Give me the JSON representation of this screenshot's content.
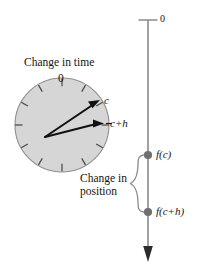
{
  "figure": {
    "type": "calculus-rate-of-change-diagram",
    "background_color": "#ffffff",
    "width": 198,
    "height": 268
  },
  "clock": {
    "caption": "Change in time",
    "dial_zero_label": "0",
    "hand_labels": {
      "short_hand": "c",
      "long_hand": "c+h"
    },
    "face_color": "#d6d6d6",
    "outline_color": "#8c8c8c",
    "hand_color": "#111111",
    "tick_count": 12,
    "center": {
      "x": 62,
      "y": 125
    },
    "radius": 47
  },
  "axis": {
    "zero_label": "0",
    "line_color": "#8a8a8a",
    "arrow_color": "#333333",
    "x": 148,
    "top_y": 20,
    "bottom_y": 258,
    "points": [
      {
        "label": "f(c)",
        "y": 155
      },
      {
        "label": "f(c+h)",
        "y": 212
      }
    ],
    "point_color": "#6f6f6f"
  },
  "brace": {
    "caption_line_1": "Change in",
    "caption_line_2": "position",
    "color": "#8a8a8a"
  }
}
